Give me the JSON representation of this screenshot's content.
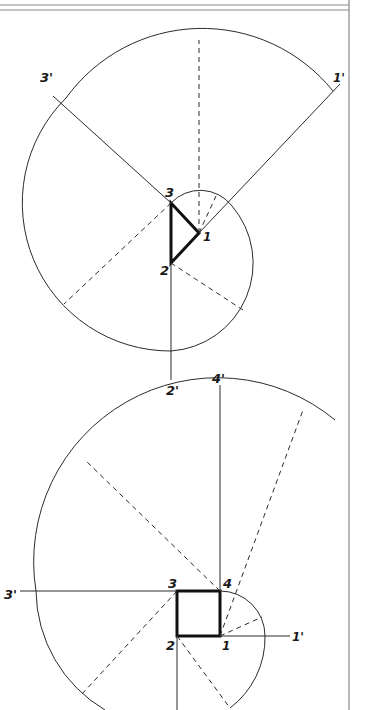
{
  "figure": {
    "type": "involute construction diagrams",
    "colors": {
      "ink": "#2b2b2b",
      "border": "#8a8a8a",
      "background": "#ffffff"
    }
  },
  "upper_figure": {
    "shape": "triangle",
    "vertex_labels": [
      "1",
      "2",
      "3"
    ],
    "extension_labels": [
      "1'",
      "2'",
      "3'"
    ]
  },
  "lower_figure": {
    "shape": "square",
    "vertex_labels": [
      "1",
      "2",
      "3",
      "4"
    ],
    "extension_labels": [
      "1'",
      "3'",
      "4'"
    ]
  }
}
